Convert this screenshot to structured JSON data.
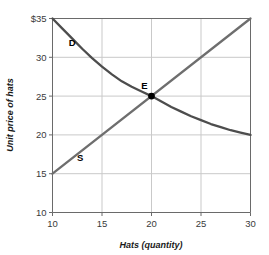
{
  "chart_data": {
    "type": "line",
    "title": "",
    "xlabel": "Hats (quantity)",
    "ylabel": "Unit price of hats",
    "xlim": [
      10,
      30
    ],
    "ylim": [
      10,
      35
    ],
    "xticks": [
      "10",
      "15",
      "20",
      "25",
      "30"
    ],
    "yticks": [
      "10",
      "15",
      "20",
      "25",
      "30",
      "$35"
    ],
    "ytick_values": [
      10,
      15,
      20,
      25,
      30,
      35
    ],
    "xtick_values": [
      10,
      15,
      20,
      25,
      30
    ],
    "grid": true,
    "legend_position": "inline-curve-labels",
    "series": [
      {
        "name": "D",
        "label": "D",
        "role": "demand",
        "color": "#4d4d4d",
        "label_x": 12.0,
        "label_y": 31.4,
        "points": [
          {
            "x": 10,
            "y": 35.0
          },
          {
            "x": 11,
            "y": 33.7
          },
          {
            "x": 12,
            "y": 32.4
          },
          {
            "x": 13,
            "y": 31.1
          },
          {
            "x": 14,
            "y": 29.9
          },
          {
            "x": 15,
            "y": 28.8
          },
          {
            "x": 16,
            "y": 27.8
          },
          {
            "x": 17,
            "y": 26.9
          },
          {
            "x": 18,
            "y": 26.2
          },
          {
            "x": 19,
            "y": 25.6
          },
          {
            "x": 20,
            "y": 25.0
          },
          {
            "x": 21,
            "y": 24.3
          },
          {
            "x": 22,
            "y": 23.6
          },
          {
            "x": 23,
            "y": 23.0
          },
          {
            "x": 24,
            "y": 22.4
          },
          {
            "x": 25,
            "y": 21.9
          },
          {
            "x": 26,
            "y": 21.4
          },
          {
            "x": 27,
            "y": 21.0
          },
          {
            "x": 28,
            "y": 20.6
          },
          {
            "x": 29,
            "y": 20.3
          },
          {
            "x": 30,
            "y": 20.0
          }
        ]
      },
      {
        "name": "S",
        "label": "S",
        "role": "supply",
        "color": "#6e6e6e",
        "label_x": 12.8,
        "label_y": 16.6,
        "points": [
          {
            "x": 10,
            "y": 15.0
          },
          {
            "x": 30,
            "y": 35.0
          }
        ]
      }
    ],
    "annotations": [
      {
        "name": "equilibrium",
        "label": "E",
        "x": 20,
        "y": 25,
        "marker": "dot",
        "marker_color": "#000000",
        "label_dx": -7,
        "label_dy": -7
      }
    ],
    "colors": {
      "grid": "#c9c9c9",
      "axis": "#6a6a6a",
      "text": "#333333",
      "background": "#ffffff",
      "demand": "#4d4d4d",
      "supply": "#6e6e6e",
      "marker": "#000000"
    }
  }
}
